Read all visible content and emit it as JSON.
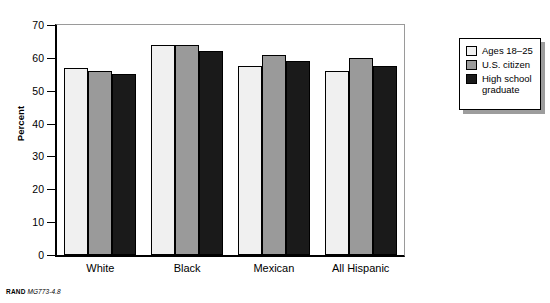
{
  "footer": {
    "organization": "RAND",
    "document_id": "MG773-4.8"
  },
  "legend": {
    "items": [
      {
        "label": "Ages 18–25",
        "color": "#f0f0f0"
      },
      {
        "label": "U.S. citizen",
        "color": "#9a9a9a"
      },
      {
        "label": "High school\ngraduate",
        "color": "#1a1a1a"
      }
    ]
  },
  "axes": {
    "y_label": "Percent",
    "y_ticks": [
      "0",
      "10",
      "20",
      "30",
      "40",
      "50",
      "60",
      "70"
    ],
    "x_ticks": [
      "White",
      "Black",
      "Mexican",
      "All Hispanic"
    ]
  },
  "chart_data": {
    "type": "bar",
    "title": "",
    "subtitle": "",
    "xlabel": "",
    "ylabel": "Percent",
    "ylim": [
      0,
      70
    ],
    "ytick_step": 10,
    "grid": false,
    "legend_position": "top-right",
    "categories": [
      "White",
      "Black",
      "Mexican",
      "All Hispanic"
    ],
    "series": [
      {
        "name": "Ages 18–25",
        "color": "#f0f0f0",
        "values": [
          57,
          64,
          57.5,
          56
        ]
      },
      {
        "name": "U.S. citizen",
        "color": "#9a9a9a",
        "values": [
          56,
          64,
          61,
          60
        ]
      },
      {
        "name": "High school graduate",
        "color": "#1a1a1a",
        "values": [
          55,
          62,
          59,
          57.5
        ]
      }
    ]
  }
}
